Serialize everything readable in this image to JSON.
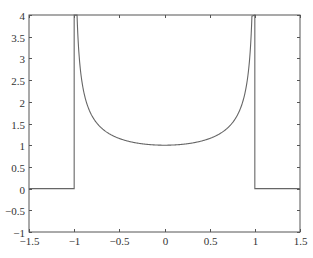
{
  "chart_data": {
    "type": "line",
    "title": "",
    "xlabel": "",
    "ylabel": "",
    "xlim": [
      -1.5,
      1.5
    ],
    "ylim": [
      -1,
      4
    ],
    "grid": false,
    "legend": null,
    "x_ticks": [
      "-1.5",
      "-1",
      "-0.5",
      "0",
      "0.5",
      "1",
      "1.5"
    ],
    "y_ticks": [
      "-1",
      "-0.5",
      "0",
      "0.5",
      "1",
      "1.5",
      "2",
      "2.5",
      "3",
      "3.5",
      "4"
    ],
    "series": [
      {
        "name": "f(x) = 1/sqrt(1 - x^2) for |x|<1, 0 otherwise (clipped at 4)",
        "color": "#666666",
        "x": [
          -1.5,
          -1.0,
          -1.0,
          -0.968,
          -0.9,
          -0.8,
          -0.7,
          -0.6,
          -0.5,
          -0.4,
          -0.3,
          -0.2,
          -0.1,
          0,
          0.1,
          0.2,
          0.3,
          0.4,
          0.5,
          0.6,
          0.7,
          0.8,
          0.9,
          0.968,
          1.0,
          1.0,
          1.5
        ],
        "y": [
          0,
          0,
          4,
          4,
          2.294,
          1.667,
          1.4,
          1.25,
          1.155,
          1.091,
          1.048,
          1.021,
          1.005,
          1.0,
          1.005,
          1.021,
          1.048,
          1.091,
          1.155,
          1.25,
          1.4,
          1.667,
          2.294,
          4,
          4,
          0,
          0
        ]
      }
    ]
  }
}
